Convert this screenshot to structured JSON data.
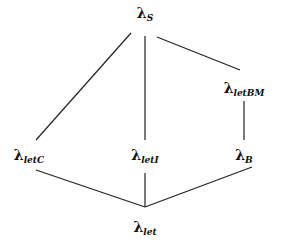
{
  "diagram": {
    "type": "lattice",
    "nodes": [
      {
        "id": "S",
        "symbol": "λ",
        "subscript": "S",
        "x": 145,
        "y": 14
      },
      {
        "id": "letBM",
        "symbol": "λ",
        "subscript": "letBM",
        "x": 244,
        "y": 89
      },
      {
        "id": "letC",
        "symbol": "λ",
        "subscript": "letC",
        "x": 29,
        "y": 156
      },
      {
        "id": "letI",
        "symbol": "λ",
        "subscript": "letI",
        "x": 145,
        "y": 156
      },
      {
        "id": "B",
        "symbol": "λ",
        "subscript": "B",
        "x": 244,
        "y": 156
      },
      {
        "id": "let",
        "symbol": "λ",
        "subscript": "let",
        "x": 145,
        "y": 228
      }
    ],
    "edges": [
      {
        "from": "S",
        "to": "letC",
        "x1": 131,
        "y1": 33,
        "x2": 36,
        "y2": 140
      },
      {
        "from": "S",
        "to": "letI",
        "x1": 145,
        "y1": 36,
        "x2": 145,
        "y2": 140
      },
      {
        "from": "S",
        "to": "letBM",
        "x1": 157,
        "y1": 37,
        "x2": 240,
        "y2": 70
      },
      {
        "from": "letBM",
        "to": "B",
        "x1": 244,
        "y1": 101,
        "x2": 244,
        "y2": 140
      },
      {
        "from": "letC",
        "to": "let",
        "x1": 36,
        "y1": 170,
        "x2": 145,
        "y2": 207
      },
      {
        "from": "letI",
        "to": "let",
        "x1": 145,
        "y1": 173,
        "x2": 145,
        "y2": 207
      },
      {
        "from": "B",
        "to": "let",
        "x1": 252,
        "y1": 167,
        "x2": 145,
        "y2": 207
      }
    ]
  }
}
